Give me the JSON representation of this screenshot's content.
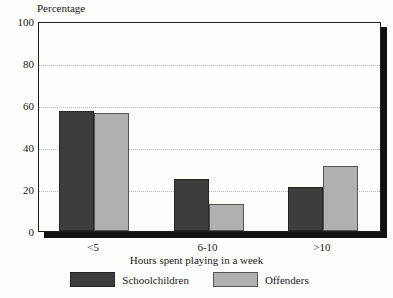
{
  "chart_data": {
    "type": "bar",
    "title": "",
    "xlabel": "Hours spent playing in a week",
    "ylabel": "Percentage",
    "categories": [
      "<5",
      "6-10",
      ">10"
    ],
    "series": [
      {
        "name": "Schoolchildren",
        "color": "#3d3d3d",
        "values": [
          57,
          25,
          21
        ]
      },
      {
        "name": "Offenders",
        "color": "#b0b0b0",
        "values": [
          56,
          13,
          31
        ]
      }
    ],
    "ylim": [
      0,
      100
    ],
    "yticks": [
      0,
      20,
      40,
      60,
      80,
      100
    ],
    "grid": "dotted-horizontal",
    "legend_position": "bottom-center"
  },
  "axes": {
    "y_title": "Percentage",
    "x_title": "Hours spent playing in a week",
    "y_ticks": [
      "100",
      "80",
      "60",
      "40",
      "20",
      "0"
    ],
    "x_ticks": [
      "<5",
      "6-10",
      ">10"
    ]
  },
  "legend": {
    "items": [
      {
        "label": "Schoolchildren",
        "swatch": "dark-square-swatch"
      },
      {
        "label": "Offenders",
        "swatch": "light-square-swatch"
      }
    ]
  }
}
